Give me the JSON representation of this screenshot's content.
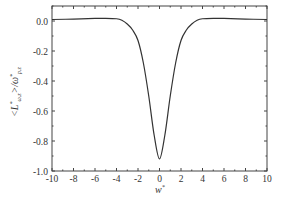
{
  "chart_data": {
    "type": "line",
    "title": "",
    "xlabel": "w*",
    "ylabel": "<L*_{ω,z}> / ω*_{p,z}",
    "xlim": [
      -10,
      10
    ],
    "ylim": [
      -1.0,
      0.1
    ],
    "xticks": [
      -10,
      -8,
      -6,
      -4,
      -2,
      0,
      2,
      4,
      6,
      8,
      10
    ],
    "xtick_labels": [
      "-10",
      "-8",
      "-6",
      "-4",
      "-2",
      "0",
      "2",
      "4",
      "6",
      "8",
      "10"
    ],
    "yticks": [
      0.0,
      -0.2,
      -0.4,
      -0.6,
      -0.8,
      -1.0
    ],
    "ytick_labels": [
      "0.0",
      "-0.2",
      "-0.4",
      "-0.6",
      "-0.8",
      "-1.0"
    ],
    "grid": false,
    "legend": null,
    "series": [
      {
        "name": "curve",
        "color": "#333333",
        "x": [
          -10,
          -8,
          -6,
          -5,
          -4,
          -3.5,
          -3,
          -2.5,
          -2,
          -1.5,
          -1,
          -0.5,
          0,
          0.5,
          1,
          1.5,
          2,
          2.5,
          3,
          3.5,
          4,
          5,
          6,
          8,
          10
        ],
        "y": [
          0.01,
          0.013,
          0.017,
          0.018,
          0.015,
          0.005,
          -0.02,
          -0.06,
          -0.13,
          -0.28,
          -0.5,
          -0.76,
          -0.92,
          -0.76,
          -0.5,
          -0.28,
          -0.13,
          -0.06,
          -0.02,
          0.005,
          0.015,
          0.018,
          0.017,
          0.013,
          0.01
        ]
      }
    ]
  },
  "axes": {
    "xlabel_main": "w",
    "xlabel_sup": "*",
    "ylabel_main": "<L",
    "ylabel_sup": "*",
    "ylabel_sub": "ω,z",
    "ylabel_rest": ">/ω",
    "ylabel_sup2": "*",
    "ylabel_sub2": "p,z"
  }
}
